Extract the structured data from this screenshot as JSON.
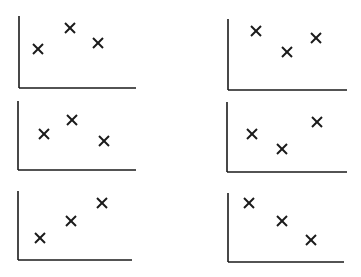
{
  "figure": {
    "ink_color": "#1a1a1a",
    "panels": [
      {
        "id": "top-left",
        "box": [
          18,
          16,
          118,
          72
        ],
        "points": [
          [
            20,
            33
          ],
          [
            52,
            12
          ],
          [
            80,
            27
          ]
        ]
      },
      {
        "id": "top-right",
        "box": [
          227,
          19,
          120,
          71
        ],
        "points": [
          [
            29,
            12
          ],
          [
            60,
            33
          ],
          [
            89,
            19
          ]
        ]
      },
      {
        "id": "middle-left",
        "box": [
          17,
          101,
          119,
          69
        ],
        "points": [
          [
            27,
            33
          ],
          [
            55,
            19
          ],
          [
            87,
            40
          ]
        ]
      },
      {
        "id": "middle-right",
        "box": [
          226,
          102,
          121,
          70
        ],
        "points": [
          [
            26,
            32
          ],
          [
            56,
            47
          ],
          [
            91,
            20
          ]
        ]
      },
      {
        "id": "bottom-left",
        "box": [
          17,
          191,
          115,
          69
        ],
        "points": [
          [
            23,
            47
          ],
          [
            54,
            30
          ],
          [
            85,
            12
          ]
        ]
      },
      {
        "id": "bottom-right",
        "box": [
          227,
          193,
          117,
          69
        ],
        "points": [
          [
            22,
            10
          ],
          [
            55,
            28
          ],
          [
            84,
            47
          ]
        ]
      }
    ]
  }
}
